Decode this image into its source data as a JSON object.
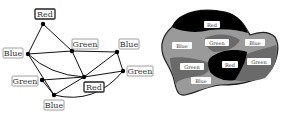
{
  "graph": {
    "nodes": [
      {
        "id": "red-top",
        "label": "Red",
        "x": 43,
        "y": 24,
        "lx": 35,
        "ly": 9,
        "lw": 20,
        "strong": true
      },
      {
        "id": "blue-left",
        "label": "Blue",
        "x": 28,
        "y": 54,
        "lx": 3,
        "ly": 48,
        "lw": 20,
        "strong": false
      },
      {
        "id": "green-mid",
        "label": "Green",
        "x": 72,
        "y": 51,
        "lx": 72,
        "ly": 39,
        "lw": 26,
        "strong": false
      },
      {
        "id": "blue-right",
        "label": "Blue",
        "x": 117,
        "y": 52,
        "lx": 119,
        "ly": 39,
        "lw": 20,
        "strong": false
      },
      {
        "id": "green-right",
        "label": "Green",
        "x": 123,
        "y": 71,
        "lx": 127,
        "ly": 66,
        "lw": 26,
        "strong": false
      },
      {
        "id": "green-left",
        "label": "Green",
        "x": 42,
        "y": 80,
        "lx": 12,
        "ly": 76,
        "lw": 26,
        "strong": false
      },
      {
        "id": "red-center",
        "label": "Red",
        "x": 84,
        "y": 77,
        "lx": 84,
        "ly": 82,
        "lw": 20,
        "strong": true
      },
      {
        "id": "blue-bottom",
        "label": "Blue",
        "x": 54,
        "y": 95,
        "lx": 44,
        "ly": 100,
        "lw": 20,
        "strong": false
      }
    ],
    "edges": [
      [
        "red-top",
        "blue-left"
      ],
      [
        "red-top",
        "green-mid"
      ],
      [
        "blue-left",
        "green-mid"
      ],
      [
        "green-mid",
        "blue-right"
      ],
      [
        "blue-left",
        "blue-bottom"
      ],
      [
        "green-mid",
        "red-center"
      ],
      [
        "blue-right",
        "red-center"
      ],
      [
        "blue-right",
        "green-right"
      ],
      [
        "green-left",
        "red-center"
      ],
      [
        "red-center",
        "green-right"
      ],
      [
        "green-left",
        "blue-bottom"
      ],
      [
        "blue-bottom",
        "red-center"
      ]
    ],
    "curved_edges": [
      {
        "from": "blue-left",
        "to": "red-center",
        "cx": 50,
        "cy": 75
      },
      {
        "from": "blue-bottom",
        "to": "green-right",
        "cx": 95,
        "cy": 105
      }
    ]
  },
  "map": {
    "regions": [
      {
        "label": "Red",
        "color": "#000000",
        "lx": 212,
        "ly": 25
      },
      {
        "label": "Blue",
        "color": "#9a9a9a",
        "lx": 182,
        "ly": 46
      },
      {
        "label": "Green",
        "color": "#6a6a6a",
        "lx": 217,
        "ly": 43
      },
      {
        "label": "Blue",
        "color": "#9a9a9a",
        "lx": 255,
        "ly": 43
      },
      {
        "label": "Red",
        "color": "#000000",
        "lx": 230,
        "ly": 65
      },
      {
        "label": "Green",
        "color": "#6a6a6a",
        "lx": 259,
        "ly": 62
      },
      {
        "label": "Green",
        "color": "#6a6a6a",
        "lx": 192,
        "ly": 67
      },
      {
        "label": "Blue",
        "color": "#9a9a9a",
        "lx": 201,
        "ly": 81
      }
    ]
  }
}
